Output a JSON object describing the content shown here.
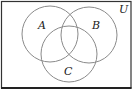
{
  "diagram": {
    "type": "venn-3",
    "universe": {
      "label": "U",
      "rect": {
        "x": 1.5,
        "y": 1.5,
        "width": 129.5,
        "height": 86.5
      },
      "stroke": "#333333",
      "label_pos": {
        "x": 119,
        "y": 13
      }
    },
    "sets": [
      {
        "label": "A",
        "cx": 50,
        "cy": 34,
        "r": 28,
        "label_pos": {
          "x": 38,
          "y": 29
        }
      },
      {
        "label": "B",
        "cx": 89,
        "cy": 35,
        "r": 28,
        "label_pos": {
          "x": 92,
          "y": 29
        }
      },
      {
        "label": "C",
        "cx": 69,
        "cy": 54,
        "r": 28,
        "label_pos": {
          "x": 64,
          "y": 75
        }
      }
    ],
    "circle_stroke": "#8a8a8a"
  }
}
